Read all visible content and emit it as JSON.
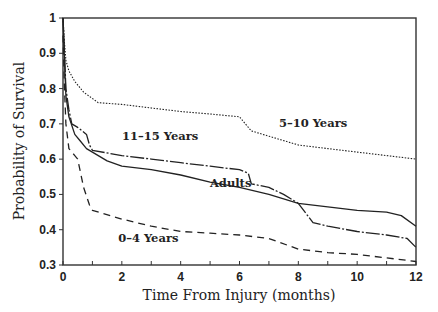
{
  "chart_data": {
    "type": "line",
    "title": "",
    "xlabel": "Time From Injury (months)",
    "ylabel": "Probability of Survival",
    "xlim": [
      0,
      12
    ],
    "ylim": [
      0.3,
      1
    ],
    "xticks": [
      0,
      2,
      4,
      6,
      8,
      10,
      12
    ],
    "xtick_labels": [
      "0",
      "2",
      "4",
      "6",
      "8",
      "10",
      "12"
    ],
    "yticks": [
      0.3,
      0.4,
      0.5,
      0.6,
      0.7,
      0.8,
      0.9,
      1
    ],
    "ytick_labels": [
      "0.3",
      "0.4",
      "0.5",
      "0.6",
      "0.7",
      "0.8",
      "0.9",
      "1"
    ],
    "grid": false,
    "legend": "inline labels",
    "series": [
      {
        "name": "5-10 Years",
        "style": "dotted",
        "x": [
          0,
          0.05,
          0.1,
          0.2,
          0.4,
          0.7,
          1.2,
          2,
          3,
          4,
          5,
          6,
          6.2,
          6.4,
          7,
          8,
          9,
          10,
          11,
          12
        ],
        "y": [
          1,
          0.93,
          0.88,
          0.85,
          0.82,
          0.79,
          0.76,
          0.755,
          0.745,
          0.735,
          0.728,
          0.72,
          0.7,
          0.68,
          0.665,
          0.64,
          0.63,
          0.62,
          0.61,
          0.6
        ]
      },
      {
        "name": "11-15 Years",
        "style": "long-dash-dot",
        "x": [
          0,
          0.05,
          0.1,
          0.2,
          0.3,
          0.5,
          0.8,
          0.9,
          1,
          2,
          3,
          4,
          5,
          6,
          6.3,
          6.4,
          7,
          7.5,
          8,
          8.5,
          9,
          10,
          11,
          11.7,
          12
        ],
        "y": [
          1,
          0.9,
          0.8,
          0.74,
          0.7,
          0.69,
          0.67,
          0.64,
          0.625,
          0.61,
          0.6,
          0.59,
          0.58,
          0.57,
          0.56,
          0.53,
          0.52,
          0.5,
          0.475,
          0.42,
          0.41,
          0.395,
          0.385,
          0.375,
          0.35
        ]
      },
      {
        "name": "Adults",
        "style": "solid",
        "x": [
          0,
          0.05,
          0.1,
          0.2,
          0.4,
          0.6,
          0.8,
          1,
          1.5,
          2,
          3,
          4,
          5,
          6,
          7,
          8,
          9,
          10,
          11,
          11.5,
          12
        ],
        "y": [
          1,
          0.88,
          0.78,
          0.72,
          0.67,
          0.65,
          0.63,
          0.62,
          0.595,
          0.58,
          0.57,
          0.555,
          0.535,
          0.52,
          0.5,
          0.475,
          0.465,
          0.455,
          0.45,
          0.44,
          0.41
        ]
      },
      {
        "name": "0-4 Years",
        "style": "dashed",
        "x": [
          0,
          0.05,
          0.1,
          0.2,
          0.4,
          0.5,
          0.7,
          0.9,
          1,
          2,
          3,
          4,
          5,
          6,
          7,
          8,
          9,
          10,
          11,
          12
        ],
        "y": [
          0.95,
          0.8,
          0.7,
          0.63,
          0.61,
          0.6,
          0.52,
          0.47,
          0.455,
          0.43,
          0.41,
          0.395,
          0.39,
          0.385,
          0.375,
          0.345,
          0.335,
          0.33,
          0.32,
          0.31
        ]
      }
    ],
    "annotations": [
      {
        "text": "5-10 Years",
        "x": 8.5,
        "y": 0.69
      },
      {
        "text": "11-15 Years",
        "x": 3.3,
        "y": 0.655
      },
      {
        "text": "Adults",
        "x": 5.7,
        "y": 0.52
      },
      {
        "text": "0-4 Years",
        "x": 2.9,
        "y": 0.365
      }
    ]
  }
}
